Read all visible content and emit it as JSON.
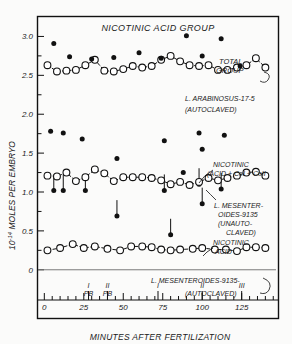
{
  "figure": {
    "title": "NICOTINIC ACID GROUP",
    "background_color": "#fbfbfa",
    "ink_color": "#111111"
  },
  "axes": {
    "y_title": "10⁻¹⁴ MOLES PER EMBRYO",
    "y_title_parts": {
      "base": "10",
      "exponent": "-14",
      "rest": " MOLES PER EMBRYO"
    },
    "x_title": "MINUTES AFTER FERTILIZATION",
    "y_ticks": [
      "0",
      "0.5",
      "1.0",
      "1.5",
      "2.0",
      "2.5",
      "3.0"
    ],
    "y_tick_values": [
      0,
      0.5,
      1.0,
      1.5,
      2.0,
      2.5,
      3.0
    ],
    "x_ticks": [
      "0",
      "25",
      "50",
      "75",
      "100",
      "125"
    ],
    "x_tick_values": [
      0,
      25,
      50,
      75,
      100,
      125
    ],
    "xlim": [
      -4,
      148
    ],
    "ylim": [
      -0.62,
      3.25
    ]
  },
  "event_markers": [
    {
      "label_top": "I",
      "label_bottom": "PB",
      "minutes": 28
    },
    {
      "label_top": "II",
      "label_bottom": "PB",
      "minutes": 40
    },
    {
      "label_top": "I",
      "label_bottom": "",
      "minutes": 72
    },
    {
      "label_top": "II",
      "label_bottom": "",
      "minutes": 100
    },
    {
      "label_top": "III",
      "label_bottom": "",
      "minutes": 125
    }
  ],
  "annotations": [
    {
      "name": "total-group",
      "lines": [
        "TOTAL",
        "GROUP"
      ]
    },
    {
      "name": "arabinosus-label",
      "lines": [
        "L. ARABINOSUS-17-5",
        "(AUTOCLAVED)"
      ]
    },
    {
      "name": "nicotinic-co-label",
      "lines": [
        "NICOTINIC",
        "(ACID + CoI + CoII"
      ]
    },
    {
      "name": "mesenteroides-unauto-label",
      "lines": [
        "L. MESENTER-",
        "OIDES-9135",
        "(UNAUTO-",
        "CLAVED)"
      ]
    },
    {
      "name": "nicotinic-acid-label",
      "lines": [
        "NICOTINIC",
        "ACID"
      ]
    },
    {
      "name": "mesenteroides-auto-label",
      "lines": [
        "L. MESENTEROIDES-9135-",
        "(AUTOCLAVED)"
      ]
    }
  ],
  "chart_data": {
    "type": "scatter",
    "title": "NICOTINIC ACID GROUP",
    "xlabel": "MINUTES AFTER FERTILIZATION",
    "ylabel": "10⁻¹⁴ MOLES PER EMBRYO",
    "xlim": [
      -4,
      148
    ],
    "ylim": [
      -0.62,
      3.25
    ],
    "grid": false,
    "legend": "inline annotations at right",
    "series": [
      {
        "name": "L. ARABINOSUS-17-5 (AUTOCLAVED) — total group",
        "marker": "open-circle",
        "line": "dashed",
        "x": [
          2,
          8,
          14,
          20,
          26,
          32,
          38,
          44,
          50,
          56,
          62,
          68,
          74,
          80,
          86,
          92,
          98,
          104,
          110,
          116,
          122,
          128,
          134,
          140
        ],
        "y": [
          2.63,
          2.55,
          2.56,
          2.57,
          2.63,
          2.7,
          2.56,
          2.55,
          2.58,
          2.62,
          2.6,
          2.62,
          2.7,
          2.75,
          2.68,
          2.63,
          2.62,
          2.63,
          2.57,
          2.57,
          2.6,
          2.63,
          2.72,
          2.6
        ]
      },
      {
        "name": "L. MESENTEROIDES-9135 (UNAUTOCLAVED) — nicotinic acid + CoI + CoII",
        "marker": "open-circle",
        "line": "dashed",
        "x": [
          2,
          8,
          14,
          20,
          26,
          32,
          38,
          44,
          50,
          56,
          62,
          68,
          74,
          80,
          86,
          92,
          98,
          104,
          110,
          116,
          122,
          128,
          134,
          140
        ],
        "y": [
          1.21,
          1.2,
          1.25,
          1.14,
          1.19,
          1.29,
          1.24,
          1.14,
          1.19,
          1.19,
          1.19,
          1.18,
          1.15,
          1.1,
          1.13,
          1.09,
          1.13,
          1.18,
          1.15,
          1.18,
          1.21,
          1.25,
          1.26,
          1.21
        ]
      },
      {
        "name": "L. MESENTEROIDES-9135 (AUTOCLAVED) — nicotinic acid",
        "marker": "open-circle",
        "line": "dashed",
        "x": [
          2,
          10,
          18,
          25,
          32,
          40,
          48,
          55,
          62,
          68,
          74,
          80,
          86,
          94,
          100,
          108,
          115,
          122,
          128,
          134,
          140
        ],
        "y": [
          0.25,
          0.28,
          0.33,
          0.28,
          0.3,
          0.27,
          0.25,
          0.3,
          0.3,
          0.29,
          0.26,
          0.25,
          0.26,
          0.27,
          0.28,
          0.26,
          0.26,
          0.24,
          0.29,
          0.29,
          0.28
        ]
      },
      {
        "name": "Upper filled points (total group replicates)",
        "marker": "filled-circle",
        "line": "none",
        "x": [
          6,
          16,
          30,
          44,
          60,
          74,
          90,
          100,
          112,
          124
        ],
        "y": [
          2.91,
          2.74,
          2.71,
          2.73,
          2.79,
          2.72,
          3.01,
          2.75,
          2.97,
          2.62
        ]
      },
      {
        "name": "Middle filled points (unautoclaved replicates)",
        "marker": "filled-circle",
        "line": "none",
        "x": [
          4,
          12,
          24,
          46,
          76,
          88,
          98,
          100,
          114
        ],
        "y": [
          1.78,
          1.76,
          1.68,
          1.43,
          1.66,
          1.25,
          1.76,
          1.55,
          1.73
        ]
      }
    ],
    "drop_markers": [
      {
        "x": 6,
        "y": 1.02
      },
      {
        "x": 12,
        "y": 1.02
      },
      {
        "x": 26,
        "y": 1.02
      },
      {
        "x": 46,
        "y": 0.69
      },
      {
        "x": 76,
        "y": 1.02
      },
      {
        "x": 80,
        "y": 0.45
      },
      {
        "x": 98,
        "y": 1.1
      },
      {
        "x": 100,
        "y": 0.85
      },
      {
        "x": 112,
        "y": 1.04
      }
    ]
  }
}
